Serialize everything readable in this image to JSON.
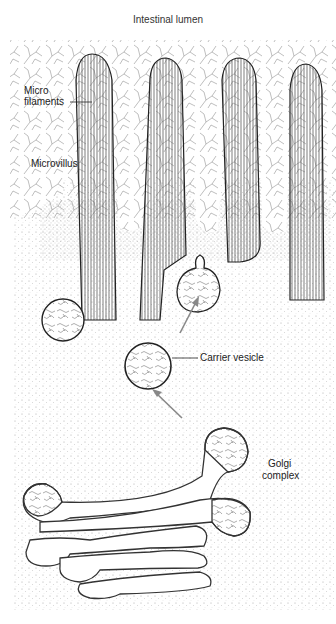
{
  "figure": {
    "title": "Intestinal lumen",
    "labels": {
      "micro_filaments_line1": "Micro",
      "micro_filaments_line2": "filaments",
      "microvillus": "Microvillus",
      "carrier_vesicle": "Carrier vesicle",
      "golgi_line1": "Golgi",
      "golgi_line2": "complex"
    },
    "colors": {
      "ink": "#222222",
      "arrow": "#888888",
      "background": "#ffffff",
      "stipple": "#9a9a9a"
    }
  }
}
